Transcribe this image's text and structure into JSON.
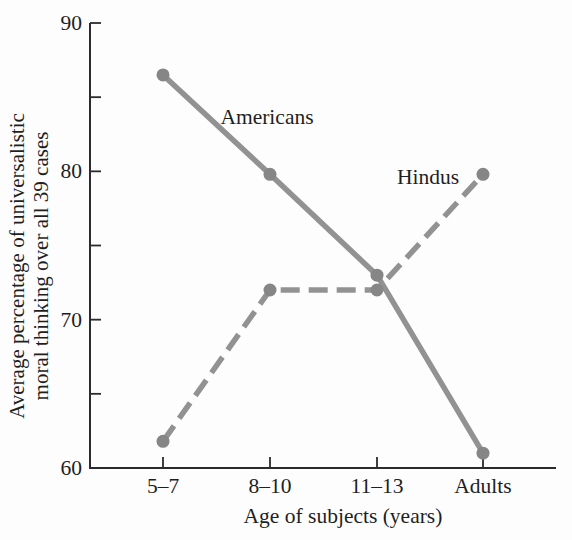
{
  "colors": {
    "background": "#fdfdfd",
    "line": "#929292",
    "marker": "#868686",
    "axis": "#2b2b2b",
    "text": "#1f1f1f"
  },
  "chart_data": {
    "type": "line",
    "categories": [
      "5–7",
      "8–10",
      "11–13",
      "Adults"
    ],
    "series": [
      {
        "name": "Americans",
        "style": "solid",
        "values": [
          86.5,
          79.8,
          73,
          61
        ],
        "label_pos": {
          "x": 267,
          "y": 124
        }
      },
      {
        "name": "Hindus",
        "style": "dashed",
        "values": [
          61.8,
          72,
          72,
          79.8
        ],
        "label_pos": {
          "x": 428,
          "y": 184
        }
      }
    ],
    "xlabel": "Age of subjects (years)",
    "ylabel_line1": "Average percentage of universalistic",
    "ylabel_line2": "moral thinking over all 39 cases",
    "ylim": [
      60,
      90
    ],
    "yticks_major": [
      90,
      80,
      70,
      60
    ],
    "yticks_minor": [
      85,
      75,
      65
    ],
    "grid": false,
    "legend_position": "inline-labels"
  }
}
